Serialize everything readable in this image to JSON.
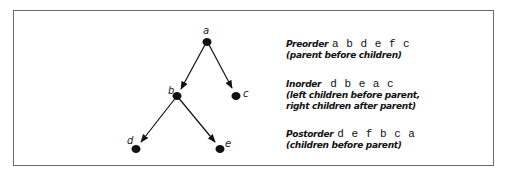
{
  "diagram": {
    "type": "binary-tree-traversal",
    "nodes": [
      {
        "id": "a",
        "label": "a",
        "x": 207,
        "y": 41
      },
      {
        "id": "b",
        "label": "b",
        "x": 177,
        "y": 96
      },
      {
        "id": "c",
        "label": "c",
        "x": 236,
        "y": 95
      },
      {
        "id": "d",
        "label": "d",
        "x": 136,
        "y": 148
      },
      {
        "id": "e",
        "label": "e",
        "x": 220,
        "y": 148
      }
    ],
    "edges": [
      {
        "from": "a",
        "to": "b"
      },
      {
        "from": "a",
        "to": "c"
      },
      {
        "from": "b",
        "to": "d"
      },
      {
        "from": "b",
        "to": "e"
      }
    ]
  },
  "legend": {
    "preorder": {
      "title": "Preorder",
      "sequence": "a b d e f c",
      "desc": [
        "(parent before children)"
      ]
    },
    "inorder": {
      "title": "Inorder",
      "sequence": "d b e a c",
      "desc": [
        "(left children before parent,",
        "right children after parent)"
      ]
    },
    "postorder": {
      "title": "Postorder",
      "sequence": "d e f b c a",
      "desc": [
        "(children before parent)"
      ]
    }
  }
}
